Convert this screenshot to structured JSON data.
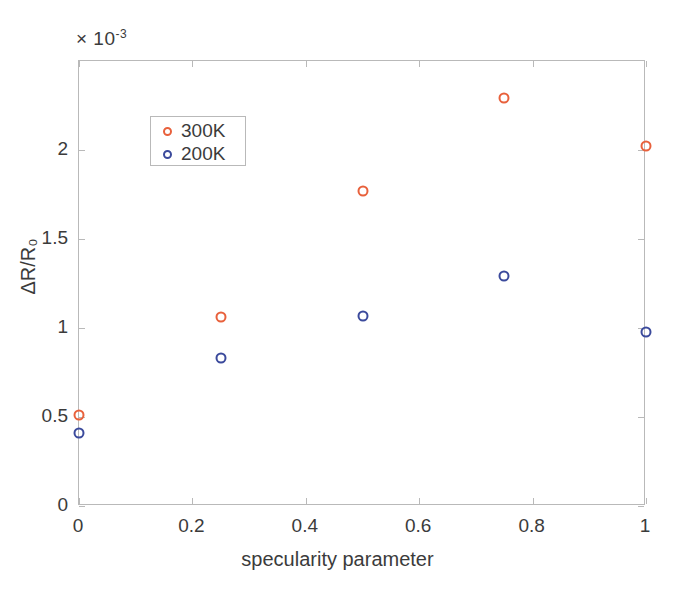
{
  "chart_data": {
    "type": "scatter",
    "title": "",
    "xlabel": "specularity parameter",
    "ylabel": "ΔR/R₀",
    "y_exponent_label": "× 10",
    "y_exponent_power": "-3",
    "xlim": [
      0,
      1
    ],
    "ylim": [
      0,
      2.5
    ],
    "xticks": [
      0,
      0.2,
      0.4,
      0.6,
      0.8,
      1
    ],
    "xtick_labels": [
      "0",
      "0.2",
      "0.4",
      "0.6",
      "0.8",
      "1"
    ],
    "yticks": [
      0,
      0.5,
      1,
      1.5,
      2
    ],
    "ytick_labels": [
      "0",
      "0.5",
      "1",
      "1.5",
      "2"
    ],
    "grid": false,
    "legend_position": "upper-left",
    "marker_style": "open-circle",
    "x": [
      0,
      0.25,
      0.5,
      0.75,
      1
    ],
    "series": [
      {
        "name": "300K",
        "color": "#e8613c",
        "values": [
          0.51,
          1.06,
          1.77,
          2.29,
          2.02
        ]
      },
      {
        "name": "200K",
        "color": "#3b4a9c",
        "values": [
          0.41,
          0.83,
          1.07,
          1.29,
          0.98
        ]
      }
    ]
  },
  "legend": {
    "entries": [
      {
        "label": "300K",
        "color": "#e8613c"
      },
      {
        "label": "200K",
        "color": "#3b4a9c"
      }
    ]
  },
  "colors": {
    "series_300k": "#e8613c",
    "series_200k": "#3b4a9c",
    "axis": "#b9b9b9",
    "text": "#3b3b3b",
    "background": "#ffffff"
  }
}
